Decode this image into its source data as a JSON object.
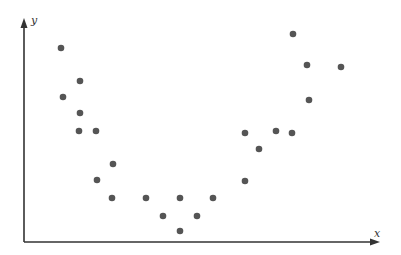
{
  "chart_data": {
    "type": "scatter",
    "title": "",
    "xlabel": "x",
    "ylabel": "y",
    "grid": false,
    "legend": null,
    "xlim": [
      0,
      354
    ],
    "ylim": [
      0,
      222
    ],
    "point_color": "#555555",
    "axis_color": "#333333",
    "series": [
      {
        "name": "points",
        "points": [
          {
            "x": 37,
            "y": 194
          },
          {
            "x": 39,
            "y": 145
          },
          {
            "x": 56,
            "y": 161
          },
          {
            "x": 56,
            "y": 129
          },
          {
            "x": 55,
            "y": 111
          },
          {
            "x": 72,
            "y": 111
          },
          {
            "x": 89,
            "y": 78
          },
          {
            "x": 73,
            "y": 62
          },
          {
            "x": 88,
            "y": 44
          },
          {
            "x": 122,
            "y": 44
          },
          {
            "x": 156,
            "y": 44
          },
          {
            "x": 189,
            "y": 44
          },
          {
            "x": 139,
            "y": 26
          },
          {
            "x": 173,
            "y": 26
          },
          {
            "x": 156,
            "y": 11
          },
          {
            "x": 221,
            "y": 61
          },
          {
            "x": 221,
            "y": 109
          },
          {
            "x": 235,
            "y": 93
          },
          {
            "x": 252,
            "y": 111
          },
          {
            "x": 268,
            "y": 109
          },
          {
            "x": 269,
            "y": 208
          },
          {
            "x": 283,
            "y": 177
          },
          {
            "x": 285,
            "y": 142
          },
          {
            "x": 317,
            "y": 175
          }
        ]
      }
    ]
  }
}
